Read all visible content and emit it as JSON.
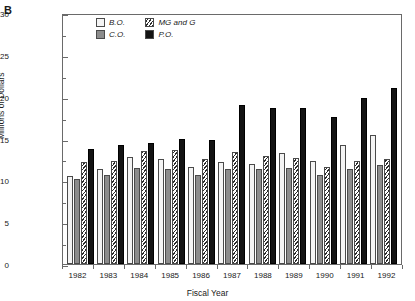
{
  "panel": {
    "label": "B"
  },
  "axes": {
    "ylabel": "Millions of Dollars",
    "xlabel": "Fiscal Year",
    "yticks": [
      0,
      5,
      10,
      15,
      20,
      25,
      30
    ],
    "ylim": [
      0,
      30
    ]
  },
  "legend": {
    "position": "top-left-inside",
    "entries": [
      {
        "key": "BO",
        "label": "B.O.",
        "style": "light-gray-fill"
      },
      {
        "key": "MGG",
        "label": "MG and G",
        "style": "diagonal-hatch"
      },
      {
        "key": "CO",
        "label": "C.O.",
        "style": "medium-gray-fill"
      },
      {
        "key": "PO",
        "label": "P.O.",
        "style": "black-fill"
      }
    ]
  },
  "colors": {
    "bo": "#f4f4f4",
    "co": "#8c8c8c",
    "mgg": "#2b2b2b",
    "po": "#131313",
    "axis": "#6a6a6a"
  },
  "chart_data": {
    "type": "bar",
    "title": "",
    "xlabel": "Fiscal Year",
    "ylabel": "Millions of Dollars",
    "ylim": [
      0,
      30
    ],
    "grid": false,
    "legend_position": "upper left inside",
    "categories": [
      "1982",
      "1983",
      "1984",
      "1985",
      "1986",
      "1987",
      "1988",
      "1989",
      "1990",
      "1991",
      "1992"
    ],
    "series": [
      {
        "name": "B.O.",
        "values": [
          10.5,
          11.3,
          12.8,
          12.5,
          11.6,
          12.2,
          11.9,
          13.3,
          12.3,
          14.2,
          15.4
        ]
      },
      {
        "name": "C.O.",
        "values": [
          10.2,
          10.6,
          11.5,
          11.3,
          10.6,
          11.4,
          11.3,
          11.5,
          10.6,
          11.3,
          11.8
        ]
      },
      {
        "name": "MG and G",
        "values": [
          12.2,
          12.3,
          13.5,
          13.6,
          12.5,
          13.4,
          12.9,
          12.7,
          11.6,
          12.3,
          12.5
        ]
      },
      {
        "name": "P.O.",
        "values": [
          13.8,
          14.2,
          14.5,
          15.0,
          14.8,
          19.0,
          18.6,
          18.7,
          17.6,
          19.9,
          21.0
        ]
      }
    ]
  }
}
